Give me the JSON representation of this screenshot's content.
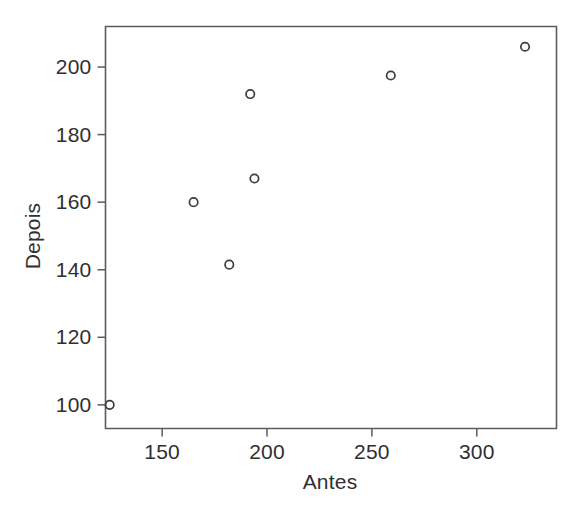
{
  "figure": {
    "background_color": "#ffffff",
    "axis_color": "#5b5b5b",
    "text_color": "#2f2f2f",
    "marker_color": "#3c3c3c"
  },
  "chart_data": {
    "type": "scatter",
    "title": "",
    "xlabel": "Antes",
    "ylabel": "Depois",
    "xlim": [
      123.0,
      338.0
    ],
    "ylim": [
      93.0,
      212.0
    ],
    "grid": false,
    "legend": null,
    "xticks": [
      150,
      200,
      250,
      300
    ],
    "xticklabels": [
      "150",
      "200",
      "250",
      "300"
    ],
    "yticks": [
      100,
      120,
      140,
      160,
      180,
      200
    ],
    "yticklabels": [
      "100",
      "120",
      "140",
      "160",
      "180",
      "200"
    ],
    "points": [
      {
        "x": 125,
        "y": 100
      },
      {
        "x": 165,
        "y": 160
      },
      {
        "x": 182,
        "y": 141.5
      },
      {
        "x": 192,
        "y": 192
      },
      {
        "x": 194,
        "y": 167
      },
      {
        "x": 259,
        "y": 197.5
      },
      {
        "x": 323,
        "y": 206
      }
    ],
    "marker": "open-circle",
    "marker_size": 4.2
  }
}
